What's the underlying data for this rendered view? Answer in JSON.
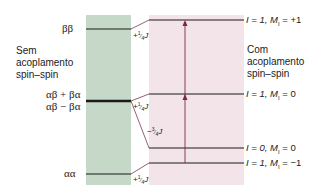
{
  "left_panel": {
    "title_lines": [
      "Sem",
      "acoplamento",
      "spin–spin"
    ],
    "levels": [
      {
        "label": "ββ"
      },
      {
        "label_top": "αβ + βα",
        "label_bottom": "αβ − βα"
      },
      {
        "label": "αα"
      }
    ]
  },
  "right_panel": {
    "title_lines": [
      "Com",
      "acoplamento",
      "spin–spin"
    ],
    "levels": [
      {
        "label": "I = 1, M_I = +1",
        "I": "I = 1, M",
        "sub": "I",
        "rest": " = +1"
      },
      {
        "label": "I = 1, M_I = 0",
        "I": "I = 1, M",
        "sub": "I",
        "rest": " = 0"
      },
      {
        "label": "I = 0, M_I = 0",
        "I": "I = 0, M",
        "sub": "I",
        "rest": " = 0"
      },
      {
        "label": "I = 1, M_I = −1",
        "I": "I = 1, M",
        "sub": "I",
        "rest": " = −1"
      }
    ]
  },
  "shifts": [
    {
      "sign": "+",
      "num": "1",
      "den": "4",
      "unit": "J"
    },
    {
      "sign": "+",
      "num": "1",
      "den": "4",
      "unit": "J"
    },
    {
      "sign": "−",
      "num": "3",
      "den": "4",
      "unit": "J"
    },
    {
      "sign": "+",
      "num": "1",
      "den": "4",
      "unit": "J"
    }
  ],
  "colors": {
    "without_coupling_bg": "#c6d9c9",
    "with_coupling_bg": "#f3e4ea",
    "level_line": "#1a1a1a",
    "connector": "#7a3a4a",
    "arrow": "#7a2a3e"
  }
}
